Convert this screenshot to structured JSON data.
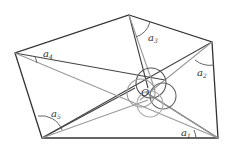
{
  "diagram": {
    "center_label": "O",
    "angle_labels": [
      {
        "id": "a1",
        "base": "a",
        "sub": "1"
      },
      {
        "id": "a2",
        "base": "a",
        "sub": "2"
      },
      {
        "id": "a3",
        "base": "a",
        "sub": "3"
      },
      {
        "id": "a4",
        "base": "a",
        "sub": "4"
      },
      {
        "id": "a5",
        "base": "a",
        "sub": "5"
      }
    ],
    "colors": {
      "dark_line": "#333333",
      "light_line": "#999999"
    }
  }
}
